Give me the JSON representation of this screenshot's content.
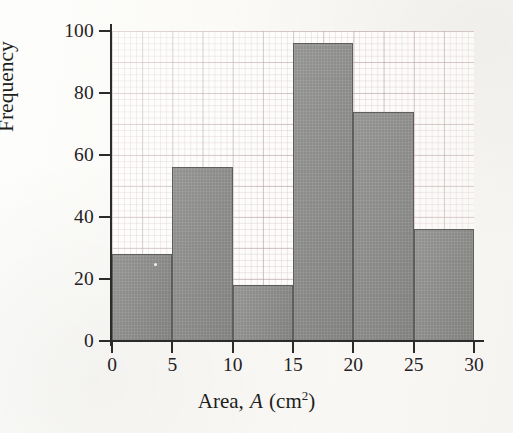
{
  "chart_data": {
    "type": "bar",
    "title": "",
    "subtitle": "",
    "xlabel_prefix": "Area,",
    "xlabel_variable": "A",
    "xlabel_units_open": "(cm",
    "xlabel_units_exp": "2",
    "xlabel_units_close": ")",
    "xlabel": "Area, A (cm2)",
    "ylabel": "Frequency",
    "grid": true,
    "legend": "none",
    "xlim": [
      0,
      30
    ],
    "ylim": [
      0,
      100
    ],
    "bin_width": 5,
    "xticks": [
      "0",
      "5",
      "10",
      "15",
      "20",
      "25",
      "30"
    ],
    "xtick_values": [
      0,
      5,
      10,
      15,
      20,
      25,
      30
    ],
    "yticks": [
      "0",
      "20",
      "40",
      "60",
      "80",
      "100"
    ],
    "ytick_values": [
      0,
      20,
      40,
      60,
      80,
      100
    ],
    "categories": [
      "0-5",
      "5-10",
      "10-15",
      "15-20",
      "20-25",
      "25-30"
    ],
    "bin_edges": [
      0,
      5,
      10,
      15,
      20,
      25,
      30
    ],
    "values": [
      28,
      56,
      18,
      96,
      74,
      36
    ],
    "bars": [
      {
        "label": "0-5",
        "start": 0,
        "end": 5,
        "value": 28
      },
      {
        "label": "5-10",
        "start": 5,
        "end": 10,
        "value": 56
      },
      {
        "label": "10-15",
        "start": 10,
        "end": 15,
        "value": 18
      },
      {
        "label": "15-20",
        "start": 15,
        "end": 20,
        "value": 96
      },
      {
        "label": "20-25",
        "start": 20,
        "end": 25,
        "value": 74
      },
      {
        "label": "25-30",
        "start": 25,
        "end": 30,
        "value": 36
      }
    ],
    "colors": {
      "bar_fill": "#8d8d8b",
      "bar_edge": "#5e5e5c",
      "axis": "#2b2b2b",
      "grid_major": "#b09698",
      "grid_minor": "#bea8aa",
      "page": "#fcfbf9",
      "text": "#25211f"
    }
  }
}
